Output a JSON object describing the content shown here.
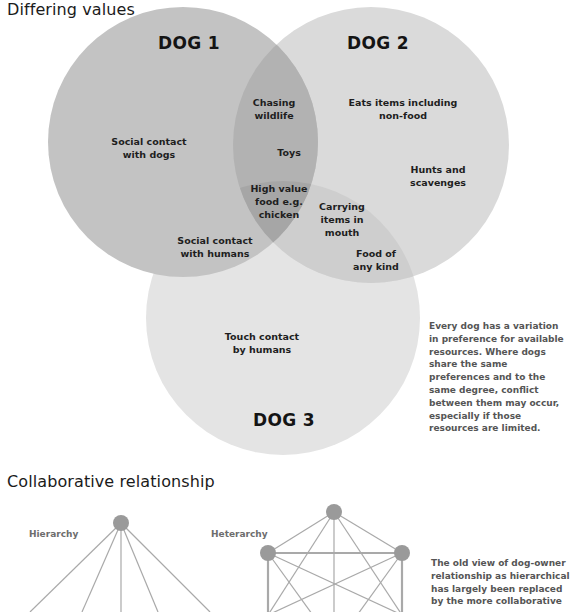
{
  "venn": {
    "title": "Differing values",
    "colors": {
      "dog1": "#c3c3c3",
      "dog2": "#dadada",
      "dog3": "#e4e4e4",
      "text": "#1e1e1e"
    },
    "sets": [
      {
        "id": "dog1",
        "label": "DOG 1",
        "cx": 183,
        "cy": 142,
        "r": 135
      },
      {
        "id": "dog2",
        "label": "DOG 2",
        "cx": 371,
        "cy": 145,
        "r": 138
      },
      {
        "id": "dog3",
        "label": "DOG 3",
        "cx": 283,
        "cy": 318,
        "r": 137
      }
    ],
    "regions": {
      "dog1_only_a": "Social contact\nwith dogs",
      "dog1_dog3_only": "Social contact\nwith humans",
      "dog1_dog2_a": "Chasing\nwildlife",
      "dog1_dog2_b": "Toys",
      "all_three": "High value\nfood e.g.\nchicken",
      "dog2_only_a": "Eats items including\nnon-food",
      "dog2_only_b": "Hunts and\nscavenges",
      "dog2_dog3_a": "Carrying\nitems in\nmouth",
      "dog2_dog3_b": "Food of\nany kind",
      "dog3_only": "Touch contact\nby humans"
    },
    "note": "Every dog has a variation in preference for available resources. Where dogs share the same preferences and to the same degree, conflict between them may occur, especially if those resources are limited."
  },
  "relationship": {
    "title": "Collaborative relationship",
    "hierarchy_label": "Hierarchy",
    "heterarchy_label": "Heterarchy",
    "node_color": "#9a9a9a",
    "line_color": "#a9a9a9",
    "note": "The old view of dog-owner relationship as hierarchical has largely been replaced by the more collaborative"
  }
}
